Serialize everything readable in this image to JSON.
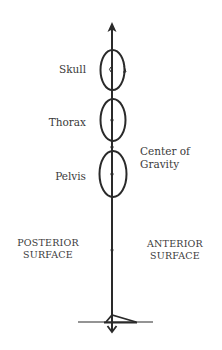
{
  "diagram": {
    "labels": {
      "skull": "Skull",
      "thorax": "Thorax",
      "pelvis": "Pelvis",
      "center_of_gravity_line1": "Center of",
      "center_of_gravity_line2": "Gravity",
      "posterior_line1": "POSTERIOR",
      "posterior_line2": "SURFACE",
      "anterior_line1": "ANTERIOR",
      "anterior_line2": "SURFACE"
    },
    "colors": {
      "line": "#2a2a2a",
      "text": "#3a3a3a",
      "background": "#ffffff"
    }
  }
}
